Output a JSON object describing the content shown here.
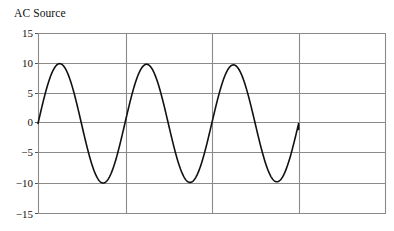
{
  "chart_data": {
    "type": "line",
    "title": "AC Source",
    "xlabel": "",
    "ylabel": "",
    "ylim": [
      -15,
      15
    ],
    "xlim": [
      0,
      4
    ],
    "ytick_labels": [
      "15",
      "10",
      "5",
      "0",
      "−5",
      "−10",
      "−15"
    ],
    "ytick_values": [
      15,
      10,
      5,
      0,
      -5,
      -10,
      -15
    ],
    "xtick_labels": [
      "",
      "",
      "",
      "",
      ""
    ],
    "xtick_values": [
      0,
      1,
      2,
      3,
      4
    ],
    "grid": true,
    "grid_color": "#808080",
    "legend": false,
    "legend_position": "none",
    "line_color": "#111111",
    "line_width": 1.6,
    "axes_color": "#555555",
    "background": "#ffffff",
    "series": [
      {
        "name": "AC Source",
        "amplitude": 10,
        "cycles": 3,
        "x_start": 0,
        "x_end": 3,
        "peaks": [
          9.7,
          9.6,
          9.4
        ],
        "troughs": [
          -10.3,
          -10.4,
          -10.5
        ],
        "end_value": -1,
        "x": [
          0,
          0.0625,
          0.125,
          0.1875,
          0.25,
          0.3125,
          0.375,
          0.4375,
          0.5,
          0.5625,
          0.625,
          0.6875,
          0.75,
          0.8125,
          0.875,
          0.9375,
          1,
          1.0625,
          1.125,
          1.1875,
          1.25,
          1.3125,
          1.375,
          1.4375,
          1.5,
          1.5625,
          1.625,
          1.6875,
          1.75,
          1.8125,
          1.875,
          1.9375,
          2,
          2.0625,
          2.125,
          2.1875,
          2.25,
          2.3125,
          2.375,
          2.4375,
          2.5,
          2.5625,
          2.625,
          2.6875,
          2.75,
          2.8125,
          2.875,
          2.9375,
          3
        ],
        "values": [
          0,
          3.7,
          6.9,
          9,
          9.7,
          9,
          6.9,
          3.7,
          0,
          -3.8,
          -7.1,
          -9.3,
          -10.1,
          -9.3,
          -7.1,
          -3.8,
          0,
          3.7,
          6.8,
          8.9,
          9.6,
          8.9,
          6.8,
          3.7,
          0,
          -3.8,
          -7.2,
          -9.4,
          -10.2,
          -9.4,
          -7.2,
          -3.8,
          0,
          3.6,
          6.7,
          8.7,
          9.4,
          8.7,
          6.7,
          3.6,
          0,
          -3.9,
          -7.3,
          -9.5,
          -10.3,
          -9.5,
          -7.3,
          -3.9,
          -1
        ]
      }
    ]
  },
  "figure": {
    "title": "AC Source"
  }
}
